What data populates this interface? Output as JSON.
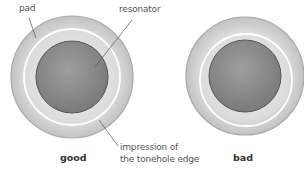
{
  "labels": {
    "pad": "pad",
    "resonator": "resonator",
    "impression_line1": "impression of",
    "impression_line2": "the tonehole edge"
  },
  "captions": {
    "good": "good",
    "bad": "bad"
  },
  "colors": {
    "pad_outer": "#cfcfcf",
    "pad_inner": "#e4e4e4",
    "pad_edge": "#a8a8a8",
    "impression_ring": "#ffffff",
    "resonator_fill": "#8c8c8c",
    "resonator_edge": "#555555",
    "leader_line": "#666666"
  },
  "diagrams": [
    {
      "name": "good",
      "cx": 72,
      "cy": 77,
      "pad_r": 61,
      "ring_cx": 72,
      "ring_cy": 77,
      "ring_r": 48,
      "res_r": 36
    },
    {
      "name": "bad",
      "cx": 245,
      "cy": 76,
      "pad_r": 59,
      "ring_cx": 246,
      "ring_cy": 80,
      "ring_r": 46,
      "res_r": 36
    }
  ]
}
